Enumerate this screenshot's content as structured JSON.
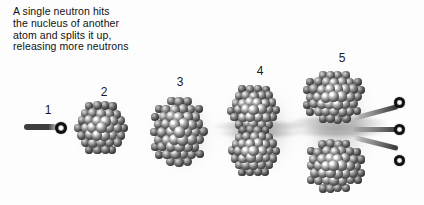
{
  "figure": {
    "caption": "A single neutron hits\nthe nucleus of another\natom and splits it up,\nreleasing more neutrons",
    "background_color": "#fdfdfd",
    "text_color": "#111111",
    "nucleon_color": "#4a4a4a",
    "neutron_color": "#000000",
    "glow_color": "#b9b9b9"
  },
  "stages": [
    {
      "number": "1",
      "name": "incoming-neutron",
      "label_x": 40,
      "label_y": 104,
      "description": "A single fast neutron travelling to the right",
      "neutron_count": 1
    },
    {
      "number": "2",
      "name": "target-nucleus",
      "label_x": 96,
      "label_y": 86,
      "description": "Nucleus of another atom, intact",
      "neutron_count": 0
    },
    {
      "number": "3",
      "name": "excited-nucleus",
      "label_x": 172,
      "label_y": 76,
      "description": "Nucleus absorbs the neutron and elongates",
      "neutron_count": 0
    },
    {
      "number": "4",
      "name": "splitting-nucleus",
      "label_x": 252,
      "label_y": 65,
      "description": "Nucleus necks and begins to split into two fragments",
      "neutron_count": 0
    },
    {
      "number": "5",
      "name": "fission-products",
      "label_x": 334,
      "label_y": 52,
      "description": "Two fission fragments fly apart releasing three more neutrons",
      "neutron_count": 3
    }
  ]
}
